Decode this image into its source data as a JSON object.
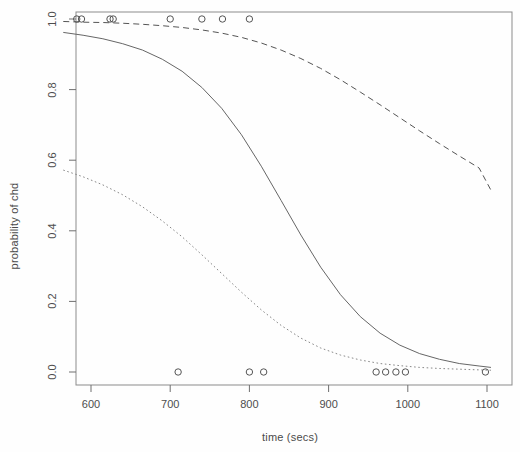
{
  "chart_data": {
    "type": "line",
    "title": "",
    "subtitle": "",
    "xlabel": "time (secs)",
    "ylabel": "probability of chd",
    "xlim": [
      565,
      1110
    ],
    "ylim": [
      0.0,
      1.0
    ],
    "grid": false,
    "legend": "none",
    "xticks": [
      600,
      700,
      800,
      900,
      1000,
      1100
    ],
    "xtick_labels": [
      "600",
      "700",
      "800",
      "900",
      "1000",
      "1100"
    ],
    "yticks": [
      0.0,
      0.2,
      0.4,
      0.6,
      0.8,
      1.0
    ],
    "ytick_labels": [
      "0.0",
      "0.2",
      "0.4",
      "0.6",
      "0.8",
      "1.0"
    ],
    "series": [
      {
        "name": "upper confidence band",
        "style": "dashed",
        "color": "#555555",
        "x": [
          565,
          590,
          615,
          640,
          665,
          690,
          715,
          740,
          765,
          790,
          815,
          840,
          865,
          890,
          915,
          940,
          965,
          990,
          1015,
          1040,
          1065,
          1090,
          1105
        ],
        "values": [
          0.993,
          0.991,
          0.99,
          0.988,
          0.985,
          0.981,
          0.976,
          0.969,
          0.96,
          0.948,
          0.932,
          0.912,
          0.888,
          0.86,
          0.828,
          0.793,
          0.757,
          0.72,
          0.683,
          0.647,
          0.612,
          0.578,
          0.515
        ]
      },
      {
        "name": "fitted probability",
        "style": "solid",
        "color": "#666666",
        "x": [
          565,
          590,
          615,
          640,
          665,
          690,
          715,
          740,
          765,
          790,
          815,
          840,
          865,
          890,
          915,
          940,
          965,
          990,
          1015,
          1040,
          1065,
          1090,
          1105
        ],
        "values": [
          0.962,
          0.954,
          0.944,
          0.93,
          0.912,
          0.886,
          0.852,
          0.806,
          0.747,
          0.672,
          0.583,
          0.486,
          0.388,
          0.297,
          0.219,
          0.157,
          0.11,
          0.076,
          0.052,
          0.036,
          0.024,
          0.017,
          0.013
        ]
      },
      {
        "name": "lower confidence band",
        "style": "dotted",
        "color": "#888888",
        "x": [
          565,
          590,
          615,
          640,
          665,
          690,
          715,
          740,
          765,
          790,
          815,
          840,
          865,
          890,
          915,
          940,
          965,
          990,
          1015,
          1040,
          1065,
          1090,
          1105
        ],
        "values": [
          0.572,
          0.553,
          0.53,
          0.502,
          0.468,
          0.428,
          0.383,
          0.332,
          0.279,
          0.226,
          0.176,
          0.132,
          0.096,
          0.068,
          0.048,
          0.034,
          0.024,
          0.018,
          0.013,
          0.01,
          0.008,
          0.006,
          0.005
        ]
      }
    ],
    "points": {
      "name": "observed chd outcomes",
      "marker": "open-circle",
      "color": "#555555",
      "x": [
        582,
        588,
        624,
        628,
        700,
        740,
        766,
        800,
        710,
        800,
        818,
        960,
        972,
        985,
        997,
        1098
      ],
      "y": [
        1,
        1,
        1,
        1,
        1,
        1,
        1,
        1,
        0,
        0,
        0,
        0,
        0,
        0,
        0,
        0
      ]
    }
  }
}
